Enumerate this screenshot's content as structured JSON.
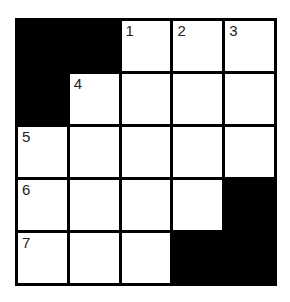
{
  "puzzle": {
    "type": "crossword",
    "rows": 5,
    "cols": 5,
    "colors": {
      "block": "#000000",
      "cell": "#ffffff",
      "line": "#000000"
    },
    "grid": [
      [
        {
          "black": true
        },
        {
          "black": true
        },
        {
          "num": "1"
        },
        {
          "num": "2"
        },
        {
          "num": "3"
        }
      ],
      [
        {
          "black": true
        },
        {
          "num": "4"
        },
        {},
        {},
        {}
      ],
      [
        {
          "num": "5"
        },
        {},
        {},
        {},
        {}
      ],
      [
        {
          "num": "6"
        },
        {},
        {},
        {},
        {
          "black": true
        }
      ],
      [
        {
          "num": "7"
        },
        {},
        {},
        {
          "black": true
        },
        {
          "black": true
        }
      ]
    ]
  }
}
